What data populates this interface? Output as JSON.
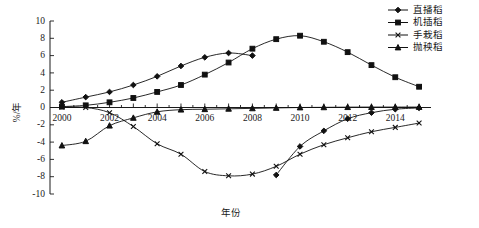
{
  "chart_data": {
    "type": "line",
    "title": "",
    "xlabel": "年份",
    "ylabel": "%/年",
    "xlim": [
      1999.5,
      2015.5
    ],
    "ylim": [
      -10,
      10
    ],
    "grid": false,
    "legend_position": "top-right",
    "x_ticks": [
      "2000",
      "2002",
      "2004",
      "2006",
      "2008",
      "2010",
      "2012",
      "2014"
    ],
    "x_tick_values": [
      2000,
      2002,
      2004,
      2006,
      2008,
      2010,
      2012,
      2014
    ],
    "y_ticks": [
      "-10",
      "-8",
      "-6",
      "-4",
      "-2",
      "0",
      "2",
      "4",
      "6",
      "8",
      "10"
    ],
    "y_tick_values": [
      -10,
      -8,
      -6,
      -4,
      -2,
      0,
      2,
      4,
      6,
      8,
      10
    ],
    "series": [
      {
        "name": "直播稻",
        "marker": "diamond",
        "x": [
          2000,
          2001,
          2002,
          2003,
          2004,
          2005,
          2006,
          2007,
          2008,
          2009,
          2010,
          2011,
          2012,
          2013,
          2014,
          2015
        ],
        "values": [
          0.6,
          1.2,
          1.8,
          2.6,
          3.6,
          4.8,
          5.8,
          6.3,
          6.0,
          -7.8,
          -4.5,
          -2.7,
          -1.3,
          -0.6,
          -0.2,
          -0.05
        ]
      },
      {
        "name": "机插稻",
        "marker": "square",
        "x": [
          2000,
          2001,
          2002,
          2003,
          2004,
          2005,
          2006,
          2007,
          2008,
          2009,
          2010,
          2011,
          2012,
          2013,
          2014,
          2015
        ],
        "values": [
          0.1,
          0.25,
          0.6,
          1.1,
          1.8,
          2.6,
          3.8,
          5.2,
          6.8,
          7.9,
          8.3,
          7.6,
          6.4,
          4.9,
          3.5,
          2.4
        ]
      },
      {
        "name": "手栽稻",
        "marker": "x",
        "x": [
          2000,
          2001,
          2002,
          2003,
          2004,
          2005,
          2006,
          2007,
          2008,
          2009,
          2010,
          2011,
          2012,
          2013,
          2014,
          2015
        ],
        "values": [
          0.05,
          0.0,
          -0.6,
          -2.2,
          -4.2,
          -5.4,
          -7.4,
          -7.9,
          -7.7,
          -6.8,
          -5.4,
          -4.3,
          -3.5,
          -2.8,
          -2.3,
          -1.8
        ]
      },
      {
        "name": "抛秧稻",
        "marker": "triangle",
        "x": [
          2000,
          2001,
          2002,
          2003,
          2004,
          2005,
          2006,
          2007,
          2008,
          2009,
          2010,
          2011,
          2012,
          2013,
          2014,
          2015
        ],
        "values": [
          -4.4,
          -3.9,
          -2.1,
          -1.2,
          -0.5,
          -0.25,
          -0.2,
          -0.15,
          -0.1,
          -0.05,
          0.0,
          0.02,
          0.04,
          0.05,
          0.05,
          0.05
        ]
      }
    ]
  }
}
